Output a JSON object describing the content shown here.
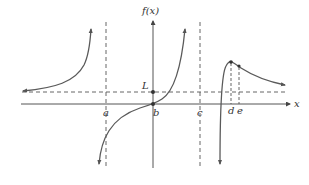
{
  "figure": {
    "y_axis_label": "f(x)",
    "x_axis_label": "x",
    "horizontal_asymptote_label": "L",
    "tick_labels": {
      "a": "a",
      "b": "b",
      "c": "c",
      "d": "d",
      "e": "e"
    },
    "colors": {
      "curve": "#5a5a5a",
      "axis": "#555555",
      "text": "#333333",
      "background": "#ffffff"
    },
    "features": {
      "vertical_asymptotes": [
        "a",
        "c"
      ],
      "horizontal_asymptote": "L",
      "points": [
        "(b, 0)",
        "(0, L)",
        "local max at d",
        "point at e"
      ]
    }
  }
}
